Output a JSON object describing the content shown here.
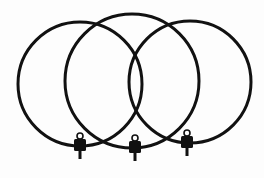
{
  "image": {
    "subject": "three overlapping loop rings with connectors",
    "background": "#fdfdfd",
    "stroke_color": "#111111",
    "loops": [
      {
        "name": "left-loop",
        "cx": 80,
        "cy": 84,
        "r": 62,
        "connector_x": 80,
        "connector_y": 138
      },
      {
        "name": "middle-loop",
        "cx": 132,
        "cy": 81,
        "r": 67,
        "connector_x": 135,
        "connector_y": 140
      },
      {
        "name": "right-loop",
        "cx": 190,
        "cy": 82,
        "r": 61,
        "connector_x": 187,
        "connector_y": 135
      }
    ]
  }
}
